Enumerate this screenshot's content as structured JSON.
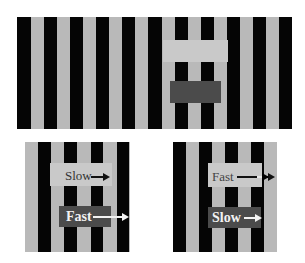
{
  "figure": {
    "colors": {
      "stripe_dark": "#050505",
      "stripe_light": "#b9b9b9",
      "gap_band": "#c9c9c9",
      "dark_box": "#4b4b4b",
      "background": "#ffffff"
    },
    "top_panel": {
      "stripe_count_dark": 11,
      "stripe_width_px": 13
    },
    "bottom_left": {
      "upper_label": "Slow",
      "upper_arrow": "right-arrow",
      "lower_label": "Fast",
      "lower_arrow": "right-arrow"
    },
    "bottom_right": {
      "upper_label": "Fast",
      "upper_arrow": "right-arrow",
      "lower_label": "Slow",
      "lower_arrow": "right-arrow"
    }
  }
}
